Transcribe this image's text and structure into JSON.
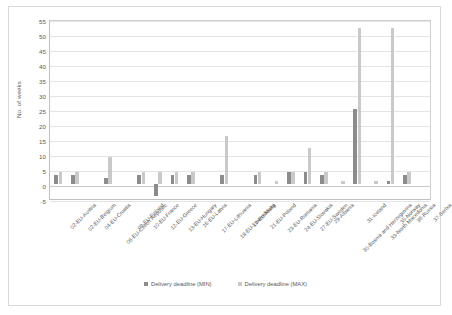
{
  "chart_data": {
    "type": "bar",
    "title": "",
    "xlabel": "",
    "ylabel": "No. of weeks",
    "ylim": [
      -5,
      55
    ],
    "yticks": [
      -5,
      0,
      5,
      10,
      15,
      20,
      25,
      30,
      35,
      40,
      45,
      50,
      55
    ],
    "grid": true,
    "legend_position": "bottom-center",
    "categories": [
      "02-EU-Austria",
      "02-EU-Belgium",
      "04-EU-Croatia",
      "06-EU-Czech Republic",
      "09-EU-Finland",
      "10-EU-France",
      "12-EU-Greece",
      "13-EU-Hungary",
      "16-EU-Latvia",
      "17-EU-Lithuania",
      "18-EU-Luxembourg",
      "19-EU-Malta",
      "21-EU-Poland",
      "23-EU-Romania",
      "24-EU-Slovakia",
      "27-EU-Sweden",
      "29-Albania",
      "30-Bosnia and Herzegovina",
      "31-Iceland",
      "33-North Macedonia",
      "35-Norway",
      "36-Russia",
      "37-Serbia"
    ],
    "series": [
      {
        "name": "Delivery deadline (MIN)",
        "color": "#8c8c8c",
        "values": [
          3,
          3,
          0,
          2,
          0,
          3,
          -4,
          3,
          3,
          0,
          3,
          0,
          3,
          0,
          4,
          4,
          3,
          0,
          25,
          0,
          1,
          3,
          0
        ]
      },
      {
        "name": "Delivery deadline (MAX)",
        "color": "#c9c9c9",
        "values": [
          4,
          4,
          0,
          9,
          0,
          4,
          4,
          4,
          4,
          0,
          16,
          0,
          4,
          1,
          4,
          12,
          4,
          1,
          52,
          1,
          52,
          4,
          0
        ]
      }
    ]
  },
  "legend": {
    "items": [
      {
        "label": "Delivery deadline (MIN)",
        "color": "#8c8c8c"
      },
      {
        "label": "Delivery deadline (MAX)",
        "color": "#c9c9c9"
      }
    ]
  }
}
